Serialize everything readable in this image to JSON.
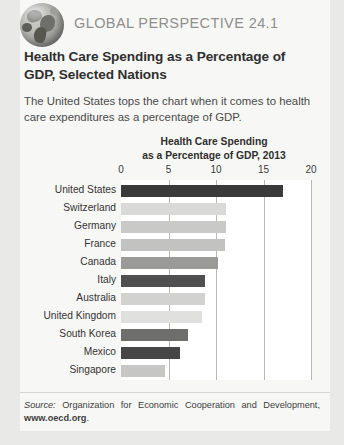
{
  "header": {
    "kicker": "GLOBAL PERSPECTIVE 24.1",
    "globe_icon": "globe-icon",
    "title": "Health Care Spending as a Percentage of GDP, Selected Nations",
    "subtitle": "The United States tops the chart when it comes to health care expenditures as a percentage of GDP."
  },
  "chart_data": {
    "type": "bar",
    "orientation": "horizontal",
    "title": "Health Care Spending as a Percentage of GDP, 2013",
    "title_line1": "Health Care Spending",
    "title_line2": "as a Percentage of GDP, 2013",
    "xlabel": "",
    "ylabel": "",
    "xlim": [
      0,
      20
    ],
    "xticks": [
      0,
      5,
      10,
      15,
      20
    ],
    "xtick_labels": [
      "0",
      "5",
      "10",
      "15",
      "20"
    ],
    "grid": true,
    "legend": false,
    "categories": [
      "United States",
      "Switzerland",
      "Germany",
      "France",
      "Canada",
      "Italy",
      "Australia",
      "United Kingdom",
      "South Korea",
      "Mexico",
      "Singapore"
    ],
    "values": [
      17.0,
      11.1,
      11.0,
      10.9,
      10.2,
      8.8,
      8.8,
      8.5,
      7.0,
      6.2,
      4.6
    ],
    "bar_colors": [
      "#3a3a3a",
      "#d9d9d7",
      "#c9c9c7",
      "#c2c2c0",
      "#9a9a98",
      "#4f4f4f",
      "#d2d2d0",
      "#e0e0de",
      "#6e6e6c",
      "#464646",
      "#c6c6c4"
    ]
  },
  "footer": {
    "source_word": "Source:",
    "source_text": "Organization for Economic Cooperation and Development,",
    "url": "www.oecd.org",
    "period": "."
  }
}
